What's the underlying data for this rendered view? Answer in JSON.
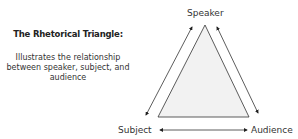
{
  "heading": {
    "title": "The Rhetorical Triangle:",
    "description": "Illustrates the relationship between speaker, subject, and audience"
  },
  "diagram": {
    "type": "triangle",
    "vertices": {
      "top": "Speaker",
      "bottom_left": "Subject",
      "bottom_right": "Audience"
    },
    "relations": [
      {
        "from": "Speaker",
        "to": "Subject",
        "bidirectional": true
      },
      {
        "from": "Speaker",
        "to": "Audience",
        "bidirectional": true
      },
      {
        "from": "Subject",
        "to": "Audience",
        "bidirectional": true
      }
    ],
    "colors": {
      "triangle_fill": "#f2f2f2",
      "stroke": "#222222"
    }
  }
}
